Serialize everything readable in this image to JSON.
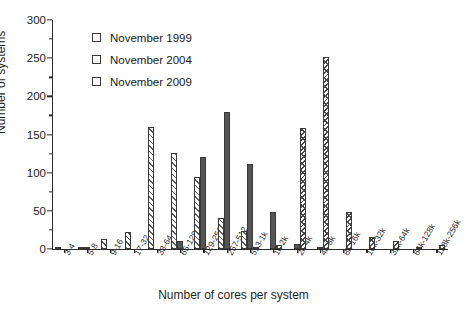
{
  "chart_data": {
    "type": "bar",
    "title": "",
    "xlabel": "Number of cores per system",
    "ylabel": "Number of systems",
    "ylim": [
      0,
      300
    ],
    "ytick_step": 50,
    "yminor_step": 25,
    "grid": false,
    "legend_position": "top-left-inside",
    "categories": [
      "3-4",
      "5-8",
      "9-16",
      "17-32",
      "33-64",
      "65-128",
      "129-256",
      "257-512",
      "513-1k",
      "1k-2k",
      "2k-4k",
      "4k-8k",
      "8k-16k",
      "16k-32k",
      "32k-64k",
      "64k-128k",
      "128k-256k"
    ],
    "series": [
      {
        "name": "November 1999",
        "color": "#ffffff",
        "pattern": "diagonal-hatch",
        "values": [
          1,
          3,
          13,
          22,
          160,
          126,
          94,
          41,
          23,
          0,
          0,
          0,
          0,
          0,
          0,
          0,
          0
        ]
      },
      {
        "name": "November 2004",
        "color": "#555555",
        "pattern": "solid",
        "values": [
          0,
          2,
          0,
          0,
          0,
          11,
          120,
          180,
          111,
          48,
          6,
          3,
          0,
          0,
          0,
          0,
          0
        ]
      },
      {
        "name": "November 2009",
        "color": "#ffffff",
        "pattern": "cross-hatch",
        "values": [
          0,
          0,
          0,
          0,
          0,
          0,
          0,
          0,
          2,
          5,
          158,
          252,
          48,
          16,
          11,
          3,
          5
        ]
      }
    ],
    "ytick_labels": [
      "0",
      "50",
      "100",
      "150",
      "200",
      "250",
      "300"
    ]
  }
}
